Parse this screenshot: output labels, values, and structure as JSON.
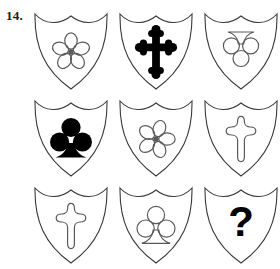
{
  "puzzle": {
    "number_label": "14.",
    "type": "matrix-reasoning-3x3",
    "missing_cell_label": "?",
    "colors": {
      "shield_outline": "#3a3a3a",
      "symbol_fill": "#000000",
      "symbol_outline": "#5a5a5a",
      "background": "#ffffff"
    },
    "grid": {
      "rows": 3,
      "columns": 3,
      "cells": [
        {
          "position": "row1-col1",
          "row": 1,
          "col": 1,
          "symbol": "rose",
          "symbol_label": "five-petal rose",
          "style": "outline",
          "rotation": 0,
          "inverted": false
        },
        {
          "position": "row1-col2",
          "row": 1,
          "col": 2,
          "symbol": "cross",
          "symbol_label": "cross bottony",
          "style": "filled",
          "rotation": 0,
          "inverted": false
        },
        {
          "position": "row1-col3",
          "row": 1,
          "col": 3,
          "symbol": "club",
          "symbol_label": "club trefoil inverted",
          "style": "outline",
          "rotation": 180,
          "inverted": true
        },
        {
          "position": "row2-col1",
          "row": 2,
          "col": 1,
          "symbol": "club",
          "symbol_label": "club trefoil",
          "style": "filled",
          "rotation": 0,
          "inverted": false
        },
        {
          "position": "row2-col2",
          "row": 2,
          "col": 2,
          "symbol": "rose",
          "symbol_label": "five-petal rose",
          "style": "outline",
          "rotation": 18,
          "inverted": false
        },
        {
          "position": "row2-col3",
          "row": 2,
          "col": 3,
          "symbol": "cross",
          "symbol_label": "cross bottony",
          "style": "outline",
          "rotation": 0,
          "inverted": false
        },
        {
          "position": "row3-col1",
          "row": 3,
          "col": 1,
          "symbol": "cross",
          "symbol_label": "cross bottony",
          "style": "outline",
          "rotation": 0,
          "inverted": false
        },
        {
          "position": "row3-col2",
          "row": 3,
          "col": 2,
          "symbol": "club",
          "symbol_label": "club trefoil",
          "style": "outline",
          "rotation": 0,
          "inverted": false
        },
        {
          "position": "row3-col3",
          "row": 3,
          "col": 3,
          "symbol": "question",
          "symbol_label": "question mark",
          "style": "filled",
          "rotation": 0,
          "inverted": false
        }
      ]
    }
  }
}
